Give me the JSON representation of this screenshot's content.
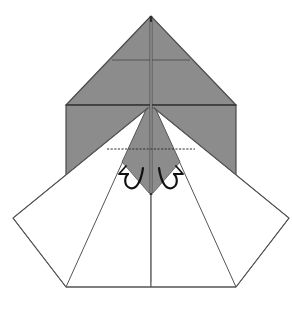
{
  "diagram": {
    "title": "",
    "type": "origami-fold-step",
    "colors": {
      "paper_back": "#8c8c8c",
      "paper_front": "#ffffff",
      "line": "#4a4a4a",
      "crease": "#6a6a6a",
      "arrow": "#1a1a1a",
      "background": "#ffffff"
    },
    "shapes": {
      "gray_top_triangle": "151,16 66,105 236,105",
      "gray_square_body": "66,105 236,105 236,175 66,175",
      "white_left_flap": "148,108 13,218 66,287 151,287 151,200",
      "white_right_flap": "154,108 289,218 236,287 151,287 151,200",
      "gray_center_kite": "148,108 154,108 181,160 151,193 121,160"
    },
    "lines": {
      "center_crease": {
        "x1": 151,
        "y1": 16,
        "x2": 151,
        "y2": 270
      },
      "top_horizontal_crease": {
        "x1": 112,
        "y1": 60,
        "x2": 190,
        "y2": 60
      },
      "square_top_edge": {
        "x1": 66,
        "y1": 105,
        "x2": 236,
        "y2": 105
      },
      "valley_fold_dashed": {
        "x1": 107,
        "y1": 149,
        "x2": 195,
        "y2": 149
      },
      "inner_left_edge": {
        "x1": 146,
        "y1": 110,
        "x2": 66,
        "y2": 287
      },
      "inner_right_edge": {
        "x1": 156,
        "y1": 110,
        "x2": 236,
        "y2": 287
      },
      "bottom_edge": {
        "x1": 66,
        "y1": 287,
        "x2": 236,
        "y2": 287
      }
    },
    "arrows": [
      {
        "name": "left-fold-arrow",
        "direction": "left"
      },
      {
        "name": "right-fold-arrow",
        "direction": "right"
      }
    ]
  }
}
